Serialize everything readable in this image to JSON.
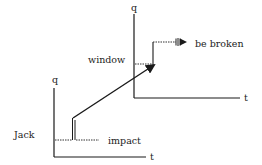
{
  "diagram": {
    "left_axes": {
      "y_label": "q",
      "x_label": "t"
    },
    "right_axes": {
      "y_label": "q",
      "x_label": "t"
    },
    "labels": {
      "jack": "Jack",
      "impact": "impact",
      "window": "window",
      "be_broken": "be broken"
    },
    "colors": {
      "stroke": "#1a1a1a",
      "text": "#222222",
      "background": "#ffffff"
    }
  }
}
